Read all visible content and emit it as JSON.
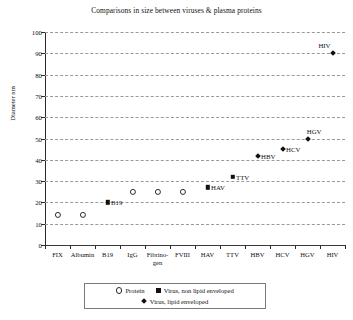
{
  "chart_data": {
    "type": "scatter",
    "title": "Comparisons in size between viruses & plasma proteins",
    "xlabel": "",
    "ylabel": "Diameter nm",
    "ylim": [
      0,
      100
    ],
    "ytick_step": 10,
    "yticks": [
      0,
      10,
      20,
      30,
      40,
      50,
      60,
      70,
      80,
      90,
      100
    ],
    "grid": true,
    "grid_style": "dashed horizontal",
    "legend_position": "bottom-center",
    "categories": [
      "FIX",
      "Albumin",
      "B19",
      "IgG",
      "Fibrino-gen",
      "FVIII",
      "HAV",
      "TTV",
      "HBV",
      "HCV",
      "HGV",
      "HIV"
    ],
    "series": [
      {
        "name": "Protein",
        "marker": "open-circle",
        "points": [
          {
            "category": "FIX",
            "value": 14,
            "label": ""
          },
          {
            "category": "Albumin",
            "value": 14,
            "label": ""
          },
          {
            "category": "IgG",
            "value": 25,
            "label": ""
          },
          {
            "category": "Fibrino-gen",
            "value": 25,
            "label": ""
          },
          {
            "category": "FVIII",
            "value": 25,
            "label": ""
          }
        ]
      },
      {
        "name": "Virus, non lipid enveloped",
        "marker": "filled-square",
        "points": [
          {
            "category": "B19",
            "value": 20,
            "label": "B19"
          },
          {
            "category": "HAV",
            "value": 27,
            "label": "HAV"
          },
          {
            "category": "TTV",
            "value": 32,
            "label": "TTV"
          }
        ]
      },
      {
        "name": "Virus, lipid enveloped",
        "marker": "filled-diamond",
        "points": [
          {
            "category": "HBV",
            "value": 42,
            "label": "HBV"
          },
          {
            "category": "HCV",
            "value": 45,
            "label": "HCV"
          },
          {
            "category": "HGV",
            "value": 50,
            "label": "HGV"
          },
          {
            "category": "HIV",
            "value": 90,
            "label": "HIV"
          }
        ]
      }
    ],
    "legend": [
      {
        "label": "Protein",
        "marker": "open-circle"
      },
      {
        "label": "Virus, non lipid enveloped",
        "marker": "filled-square"
      },
      {
        "label": "Virus, lipid enveloped",
        "marker": "filled-diamond"
      }
    ]
  }
}
